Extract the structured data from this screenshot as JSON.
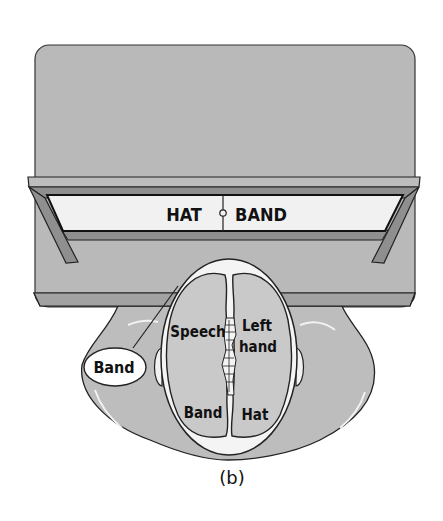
{
  "figure": {
    "panel_label": "(b)",
    "screen": {
      "left_label": "HAT",
      "right_label": "BAND",
      "fixation_point": "fixation-circle"
    },
    "brain": {
      "left_hemisphere_top": "Speech",
      "right_hemisphere_top_line1": "Left",
      "right_hemisphere_top_line2": "hand",
      "left_hemisphere_bottom": "Band",
      "right_hemisphere_bottom": "Hat"
    },
    "speech_bubble": {
      "text": "Band"
    }
  },
  "colors": {
    "board": "#b9b9b9",
    "board_edge": "#9a9a9a",
    "frame": "#8f8f8f",
    "screen": "#f1f1f1",
    "body": "#bdbdbd",
    "head_outline": "#f4f4f4",
    "brain": "#c9c9c9",
    "ink": "#111111"
  }
}
